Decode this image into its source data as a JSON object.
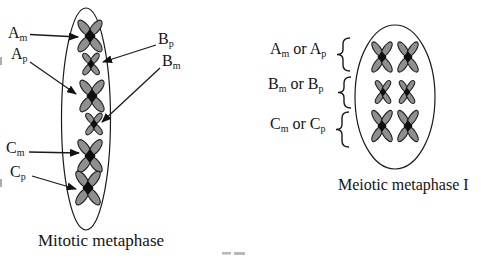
{
  "mitotic": {
    "caption": "Mitotic metaphase",
    "labels": [
      {
        "id": "Am",
        "base": "A",
        "sub": "m"
      },
      {
        "id": "Ap",
        "base": "A",
        "sub": "p"
      },
      {
        "id": "Bp",
        "base": "B",
        "sub": "p"
      },
      {
        "id": "Bm",
        "base": "B",
        "sub": "m"
      },
      {
        "id": "Cm",
        "base": "C",
        "sub": "m"
      },
      {
        "id": "Cp",
        "base": "C",
        "sub": "p"
      }
    ],
    "cell": {
      "cx": 86,
      "cy": 119,
      "rx": 24.5,
      "ry": 111
    },
    "chromosomes": [
      {
        "label": "Am",
        "size": "large",
        "x": 90,
        "y": 36,
        "w": 28,
        "h": 34
      },
      {
        "label": "Bp",
        "size": "small",
        "x": 91,
        "y": 64,
        "w": 19,
        "h": 23
      },
      {
        "label": "Ap",
        "size": "large",
        "x": 92,
        "y": 96,
        "w": 28,
        "h": 34
      },
      {
        "label": "Bm",
        "size": "small",
        "x": 94,
        "y": 124,
        "w": 19,
        "h": 23
      },
      {
        "label": "Cm",
        "size": "large",
        "x": 90,
        "y": 156,
        "w": 28,
        "h": 35
      },
      {
        "label": "Cp",
        "size": "large",
        "x": 88,
        "y": 188,
        "w": 28,
        "h": 36
      }
    ],
    "arrows": [
      {
        "points_to": "Am",
        "from": [
          30,
          34.5
        ],
        "to": [
          78,
          37
        ]
      },
      {
        "points_to": "Ap",
        "from": [
          30,
          62
        ],
        "to": [
          76,
          94
        ]
      },
      {
        "points_to": "Bp",
        "from": [
          156,
          45
        ],
        "to": [
          103,
          62
        ]
      },
      {
        "points_to": "Bm",
        "from": [
          160,
          68
        ],
        "to": [
          102,
          122
        ]
      },
      {
        "points_to": "Cm",
        "from": [
          29,
          152
        ],
        "to": [
          79,
          153
        ]
      },
      {
        "points_to": "Cp",
        "from": [
          32,
          176
        ],
        "to": [
          76,
          189
        ]
      }
    ]
  },
  "meiotic": {
    "caption": "Meiotic metaphase I",
    "groups": [
      {
        "id": "A",
        "base1": "A",
        "sub1": "m",
        "mid": " or ",
        "base2": "A",
        "sub2": "p"
      },
      {
        "id": "B",
        "base1": "B",
        "sub1": "m",
        "mid": " or ",
        "base2": "B",
        "sub2": "p"
      },
      {
        "id": "C",
        "base1": "C",
        "sub1": "m",
        "mid": " or ",
        "base2": "C",
        "sub2": "p"
      }
    ],
    "cell": {
      "cx": 395,
      "cy": 97,
      "rx": 40,
      "ry": 72
    },
    "chromosomes": [
      {
        "row": "A",
        "size": "large",
        "x": 382,
        "y": 57,
        "w": 23,
        "h": 32
      },
      {
        "row": "A",
        "size": "large",
        "x": 408,
        "y": 57,
        "w": 23,
        "h": 32
      },
      {
        "row": "B",
        "size": "small",
        "x": 383,
        "y": 92,
        "w": 17,
        "h": 24
      },
      {
        "row": "B",
        "size": "small",
        "x": 407,
        "y": 92,
        "w": 17,
        "h": 24
      },
      {
        "row": "C",
        "size": "large",
        "x": 382,
        "y": 126,
        "w": 23,
        "h": 33
      },
      {
        "row": "C",
        "size": "large",
        "x": 408,
        "y": 126,
        "w": 23,
        "h": 33
      }
    ],
    "braces": [
      {
        "row": "A",
        "x": 337,
        "y0": 38,
        "y1": 71
      },
      {
        "row": "B",
        "x": 338,
        "y0": 77,
        "y1": 108
      },
      {
        "row": "C",
        "x": 336,
        "y0": 112,
        "y1": 147
      }
    ]
  },
  "colors": {
    "line": "#1a1a1a",
    "chromosome_fill": "#8f8f8f",
    "chromosome_stroke": "#1f1f1f",
    "centromere": "#0e0e0e",
    "background": "#ffffff",
    "artifact": "#9a9a9a"
  }
}
